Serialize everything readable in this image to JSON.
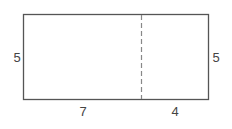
{
  "diagram": {
    "type": "composite-rectangle",
    "labels": {
      "left_height": "5",
      "right_height": "5",
      "bottom_left_width": "7",
      "bottom_right_width": "4"
    },
    "colors": {
      "stroke": "#555555",
      "dash": "#888888",
      "text": "#444444"
    }
  }
}
